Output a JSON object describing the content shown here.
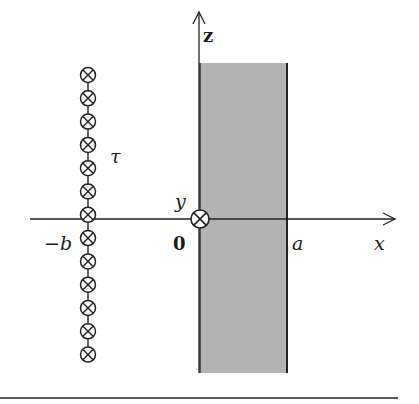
{
  "figure": {
    "labels": {
      "z_axis": "z",
      "x_axis": "x",
      "y_axis": "y",
      "origin": "0",
      "slab_edge": "a",
      "chain_position": "−b",
      "chain_label": "τ"
    },
    "colors": {
      "slab_fill": "#b3b3b3",
      "line": "#222222",
      "background": "#ffffff"
    },
    "chain": {
      "count": 13,
      "center_x": 88,
      "first_y": 75,
      "spacing": 23.3,
      "radius": 7.5,
      "symbol": "current-into-page"
    },
    "slab": {
      "x_left": 200,
      "x_right": 287,
      "y_top": 63,
      "y_bottom": 373
    },
    "axes": {
      "origin_x": 199,
      "origin_y": 219,
      "x_start": 30,
      "x_end": 395,
      "z_top": 12
    }
  }
}
